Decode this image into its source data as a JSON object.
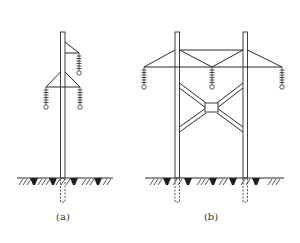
{
  "figure": {
    "panels": [
      {
        "id": "a",
        "label": "(a)",
        "description": "single pole with three insulators (one upper right, two lower on both sides)"
      },
      {
        "id": "b",
        "label": "(b)",
        "description": "H-frame two-pole structure with X-bracing and three insulators"
      }
    ]
  },
  "colors": {
    "line": "#2b2b2b",
    "background": "#ffffff"
  }
}
